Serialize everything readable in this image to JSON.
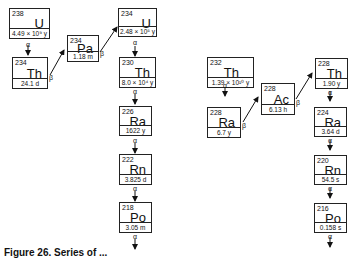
{
  "series_u238": [
    {
      "mass": "238",
      "symbol": "U",
      "half_life": "4.49 × 10⁹ y"
    },
    {
      "mass": "234",
      "symbol": "Th",
      "half_life": "24.1  d"
    },
    {
      "mass": "234",
      "symbol": "Pa",
      "half_life": "1.18  m"
    },
    {
      "mass": "234",
      "symbol": "U",
      "half_life": "2.48 × 10⁵ y"
    },
    {
      "mass": "230",
      "symbol": "Th",
      "half_life": "8.0 × 10⁴ y"
    },
    {
      "mass": "226",
      "symbol": "Ra",
      "half_life": "1622  y"
    },
    {
      "mass": "222",
      "symbol": "Rn",
      "half_life": "3.825  d"
    },
    {
      "mass": "218",
      "symbol": "Po",
      "half_life": "3.05  m"
    }
  ],
  "series_th232": [
    {
      "mass": "232",
      "symbol": "Th",
      "half_life": "1.39 × 10¹⁰ y"
    },
    {
      "mass": "228",
      "symbol": "Ra",
      "half_life": "6.7  y"
    },
    {
      "mass": "228",
      "symbol": "Ac",
      "half_life": "6.13  h"
    },
    {
      "mass": "228",
      "symbol": "Th",
      "half_life": "1.90  y"
    },
    {
      "mass": "224",
      "symbol": "Ra",
      "half_life": "3.64  d"
    },
    {
      "mass": "220",
      "symbol": "Rn",
      "half_life": "54.5  s"
    },
    {
      "mass": "216",
      "symbol": "Po",
      "half_life": "0.158  s"
    }
  ],
  "decay_labels": {
    "alpha": "α",
    "beta": "β"
  },
  "caption": "Figure 26.  Series of ..."
}
